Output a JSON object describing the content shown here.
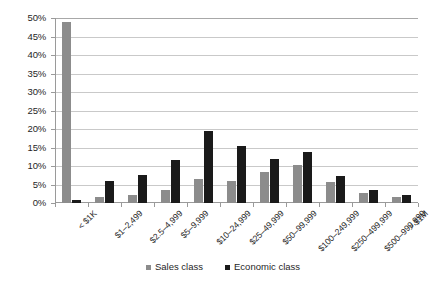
{
  "chart_data": {
    "type": "bar",
    "title": "",
    "subtitle": "",
    "xlabel": "",
    "ylabel": "",
    "ylim": [
      0,
      50
    ],
    "ytick_values": [
      0,
      5,
      10,
      15,
      20,
      25,
      30,
      35,
      40,
      45,
      50
    ],
    "ytick_labels": [
      "0%",
      "5%",
      "10%",
      "15%",
      "20%",
      "25%",
      "30%",
      "35%",
      "40%",
      "45%",
      "50%"
    ],
    "grid": true,
    "legend_position": "bottom",
    "categories": [
      "< $1K",
      "$1–2,499",
      "$2.5–4,999",
      "$5–9,999",
      "$10–24,999",
      "$25–49,999",
      "$50–99,999",
      "$100–249,999",
      "$250–499,999",
      "$500–999,999",
      "> $1M"
    ],
    "series": [
      {
        "name": "Sales class",
        "color": "#8c8c8c",
        "values": [
          49.0,
          1.7,
          2.2,
          3.5,
          6.6,
          6.0,
          8.3,
          10.2,
          5.8,
          2.6,
          1.6
        ]
      },
      {
        "name": "Economic class",
        "color": "#1a1a1a",
        "values": [
          0.9,
          5.9,
          7.7,
          11.7,
          19.5,
          15.3,
          11.8,
          13.8,
          7.2,
          3.5,
          2.1
        ]
      }
    ]
  },
  "legend": {
    "entries": [
      {
        "label": "Sales class",
        "swatch": "sales-swatch"
      },
      {
        "label": "Economic class",
        "swatch": "economic-swatch"
      }
    ]
  }
}
